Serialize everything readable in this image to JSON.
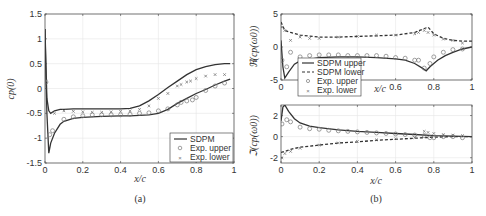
{
  "chart_data": [
    {
      "id": "a",
      "type": "line",
      "caption": "(a)",
      "title": "",
      "xlabel": "x/c",
      "ylabel": "c_p(0)",
      "xlim": [
        0,
        1
      ],
      "ylim": [
        -1.5,
        1.5
      ],
      "xticks": [
        0,
        0.2,
        0.4,
        0.6,
        0.8,
        1
      ],
      "yticks": [
        -1.5,
        -1,
        -0.5,
        0,
        0.5,
        1,
        1.5
      ],
      "grid": true,
      "legend_position": "lower right",
      "legend": [
        "SDPM",
        "Exp. upper",
        "Exp. lower"
      ],
      "series": [
        {
          "name": "SDPM (upper)",
          "style": "solid",
          "x": [
            0,
            0.005,
            0.01,
            0.02,
            0.03,
            0.05,
            0.08,
            0.1,
            0.15,
            0.2,
            0.3,
            0.4,
            0.45,
            0.5,
            0.55,
            0.6,
            0.65,
            0.7,
            0.75,
            0.8,
            0.85,
            0.9,
            0.95,
            0.98
          ],
          "y": [
            1.2,
            0.3,
            -0.5,
            -1.3,
            -1.1,
            -0.9,
            -0.72,
            -0.66,
            -0.6,
            -0.58,
            -0.56,
            -0.55,
            -0.55,
            -0.54,
            -0.53,
            -0.5,
            -0.42,
            -0.3,
            -0.2,
            -0.1,
            -0.02,
            0.07,
            0.15,
            0.19
          ]
        },
        {
          "name": "SDPM (lower)",
          "style": "solid",
          "x": [
            0,
            0.005,
            0.01,
            0.02,
            0.03,
            0.05,
            0.08,
            0.1,
            0.15,
            0.2,
            0.3,
            0.4,
            0.45,
            0.5,
            0.55,
            0.6,
            0.65,
            0.7,
            0.75,
            0.8,
            0.85,
            0.9,
            0.95,
            0.98
          ],
          "y": [
            1.2,
            0.5,
            -0.2,
            -0.45,
            -0.5,
            -0.45,
            -0.42,
            -0.42,
            -0.41,
            -0.41,
            -0.41,
            -0.41,
            -0.4,
            -0.35,
            -0.25,
            -0.12,
            0.02,
            0.15,
            0.28,
            0.38,
            0.44,
            0.48,
            0.5,
            0.5
          ]
        },
        {
          "name": "Exp. upper",
          "marker": "circle",
          "x": [
            0.005,
            0.025,
            0.04,
            0.1,
            0.15,
            0.2,
            0.25,
            0.3,
            0.35,
            0.4,
            0.45,
            0.5,
            0.55,
            0.6,
            0.65,
            0.7,
            0.72,
            0.75,
            0.78,
            0.8,
            0.85,
            0.9,
            0.95
          ],
          "y": [
            0.13,
            -0.93,
            -0.85,
            -0.62,
            -0.57,
            -0.55,
            -0.53,
            -0.53,
            -0.53,
            -0.53,
            -0.52,
            -0.5,
            -0.49,
            -0.45,
            -0.41,
            -0.33,
            -0.28,
            -0.25,
            -0.23,
            -0.18,
            -0.04,
            0.05,
            0.11
          ]
        },
        {
          "name": "Exp. lower",
          "marker": "x",
          "x": [
            0.005,
            0.05,
            0.1,
            0.15,
            0.2,
            0.25,
            0.3,
            0.35,
            0.4,
            0.45,
            0.5,
            0.55,
            0.6,
            0.65,
            0.7,
            0.72,
            0.75,
            0.77,
            0.8,
            0.85,
            0.9,
            0.95
          ],
          "y": [
            0.15,
            -0.5,
            -0.45,
            -0.46,
            -0.47,
            -0.48,
            -0.48,
            -0.47,
            -0.46,
            -0.45,
            -0.42,
            -0.35,
            -0.2,
            -0.1,
            0.05,
            0.08,
            0.13,
            0.15,
            0.2,
            0.25,
            0.28,
            0.28
          ]
        }
      ]
    },
    {
      "id": "b-top",
      "type": "line",
      "caption": "(b)",
      "xlabel": "x/c",
      "ylabel": "ℜ(c_p(ω_0))",
      "xlim": [
        0,
        1
      ],
      "ylim": [
        -5,
        5
      ],
      "xticks": [
        0,
        0.6,
        0.8,
        1
      ],
      "yticks": [
        -5,
        0,
        5
      ],
      "grid": true,
      "legend_position": "lower left",
      "legend": [
        "SDPM upper",
        "SDPM lower",
        "Exp. upper",
        "Exp. lower"
      ],
      "series": [
        {
          "name": "SDPM upper",
          "style": "solid",
          "x": [
            0,
            0.01,
            0.02,
            0.04,
            0.07,
            0.1,
            0.2,
            0.3,
            0.4,
            0.5,
            0.6,
            0.65,
            0.7,
            0.74,
            0.76,
            0.78,
            0.82,
            0.86,
            0.9,
            0.95,
            1.0
          ],
          "y": [
            1,
            -3,
            -4.7,
            -3.8,
            -2.6,
            -2.1,
            -1.6,
            -1.5,
            -1.5,
            -1.6,
            -1.8,
            -2.0,
            -2.5,
            -3.2,
            -3.6,
            -3.0,
            -2.0,
            -1.3,
            -0.8,
            -0.3,
            0
          ]
        },
        {
          "name": "SDPM lower",
          "style": "dashed",
          "x": [
            0,
            0.02,
            0.05,
            0.1,
            0.2,
            0.3,
            0.4,
            0.5,
            0.6,
            0.7,
            0.75,
            0.77,
            0.8,
            0.85,
            0.9,
            0.95,
            1.0
          ],
          "y": [
            3.8,
            2.5,
            2.2,
            1.8,
            1.5,
            1.5,
            1.6,
            1.7,
            1.8,
            2.2,
            2.8,
            3.0,
            2.0,
            1.3,
            1.0,
            0.9,
            0.9
          ]
        },
        {
          "name": "Exp. upper",
          "marker": "circle",
          "x": [
            0.005,
            0.03,
            0.05,
            0.1,
            0.15,
            0.2,
            0.25,
            0.3,
            0.35,
            0.4,
            0.45,
            0.5,
            0.55,
            0.6,
            0.65,
            0.7,
            0.72,
            0.75,
            0.78,
            0.8,
            0.85,
            0.9,
            0.95
          ],
          "y": [
            -2.0,
            -3.0,
            -0.8,
            -1.5,
            -1.3,
            -1.2,
            -1.2,
            -1.2,
            -1.3,
            -1.3,
            -1.3,
            -1.3,
            -1.4,
            -1.6,
            -1.7,
            -2.0,
            -2.0,
            -3.2,
            -2.5,
            -1.5,
            -0.8,
            -0.4,
            -0.3
          ]
        },
        {
          "name": "Exp. lower",
          "marker": "x",
          "x": [
            0.005,
            0.02,
            0.05,
            0.1,
            0.15,
            0.2,
            0.3,
            0.4,
            0.5,
            0.6,
            0.7,
            0.72,
            0.75,
            0.77,
            0.8,
            0.85,
            0.9,
            0.95
          ],
          "y": [
            3.0,
            2.5,
            1.0,
            1.5,
            1.3,
            1.3,
            1.5,
            1.6,
            1.8,
            1.8,
            2.0,
            2.2,
            2.5,
            2.2,
            1.8,
            1.2,
            1.0,
            0.6
          ]
        }
      ]
    },
    {
      "id": "b-bottom",
      "type": "line",
      "xlabel": "x/c",
      "ylabel": "ℑ(c_p(ω_0))",
      "xlim": [
        0,
        1
      ],
      "ylim": [
        -2.5,
        3
      ],
      "xticks": [
        0,
        0.2,
        0.4,
        0.6,
        0.8,
        1
      ],
      "yticks": [
        -2,
        0,
        2
      ],
      "grid": true,
      "series": [
        {
          "name": "SDPM upper",
          "style": "solid",
          "x": [
            0,
            0.01,
            0.02,
            0.04,
            0.07,
            0.1,
            0.15,
            0.2,
            0.3,
            0.4,
            0.5,
            0.6,
            0.7,
            0.8,
            0.9,
            1.0
          ],
          "y": [
            1.5,
            2.8,
            3.0,
            2.4,
            1.7,
            1.3,
            1.0,
            0.85,
            0.65,
            0.5,
            0.4,
            0.3,
            0.2,
            0.1,
            0.05,
            0
          ]
        },
        {
          "name": "SDPM lower",
          "style": "dashed",
          "x": [
            0,
            0.02,
            0.05,
            0.1,
            0.2,
            0.3,
            0.4,
            0.5,
            0.6,
            0.7,
            0.8,
            0.9,
            1.0
          ],
          "y": [
            -1.5,
            -1.4,
            -1.2,
            -1.0,
            -0.8,
            -0.6,
            -0.5,
            -0.35,
            -0.25,
            -0.15,
            -0.05,
            0,
            0
          ]
        },
        {
          "name": "Exp. upper",
          "marker": "circle",
          "x": [
            0.005,
            0.03,
            0.05,
            0.1,
            0.15,
            0.2,
            0.25,
            0.3,
            0.35,
            0.4,
            0.45,
            0.5,
            0.55,
            0.6,
            0.65,
            0.7,
            0.75,
            0.78,
            0.8,
            0.85,
            0.9,
            0.95
          ],
          "y": [
            1.2,
            1.6,
            1.4,
            0.9,
            0.75,
            0.7,
            0.6,
            0.55,
            0.5,
            0.45,
            0.4,
            0.35,
            0.3,
            0.25,
            0.2,
            0.15,
            0.1,
            -0.1,
            -0.1,
            0,
            0,
            -0.1
          ]
        },
        {
          "name": "Exp. lower",
          "marker": "x",
          "x": [
            0.005,
            0.02,
            0.05,
            0.1,
            0.2,
            0.3,
            0.4,
            0.5,
            0.6,
            0.7,
            0.75,
            0.77,
            0.8,
            0.85,
            0.9,
            0.95
          ],
          "y": [
            -2.0,
            -1.6,
            -1.4,
            -1.1,
            -0.8,
            -0.6,
            -0.45,
            -0.3,
            -0.2,
            -0.1,
            0.5,
            0.4,
            0.3,
            0.2,
            0.15,
            0.1
          ]
        }
      ]
    }
  ],
  "captions": {
    "a": "(a)",
    "b": "(b)"
  },
  "labels": {
    "a_xlabel": "x/c",
    "a_ylabel": "cp(0)",
    "b_top_xlabel": "x/c",
    "b_top_ylabel": "ℜ(cp(ω0))",
    "b_bottom_xlabel": "x/c",
    "b_bottom_ylabel": "ℑ(cp(ω0))"
  },
  "legend_a": [
    "SDPM",
    "Exp. upper",
    "Exp. lower"
  ],
  "legend_b": [
    "SDPM upper",
    "SDPM lower",
    "Exp. upper",
    "Exp. lower"
  ],
  "colors": {
    "line": "#333333",
    "marker": "#777777",
    "grid": "#e6e6e6",
    "axis": "#444444"
  }
}
